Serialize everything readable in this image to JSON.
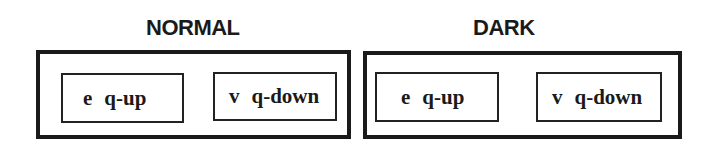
{
  "panels": [
    {
      "title": "NORMAL",
      "keys": [
        {
          "glyph": "e",
          "label": "q-up"
        },
        {
          "glyph": "v",
          "label": "q-down"
        }
      ]
    },
    {
      "title": "DARK",
      "keys": [
        {
          "glyph": "e",
          "label": "q-up"
        },
        {
          "glyph": "v",
          "label": "q-down"
        }
      ]
    }
  ],
  "colors": {
    "border": "#1a1a1a",
    "background": "#ffffff",
    "text": "#1a1a1a"
  }
}
